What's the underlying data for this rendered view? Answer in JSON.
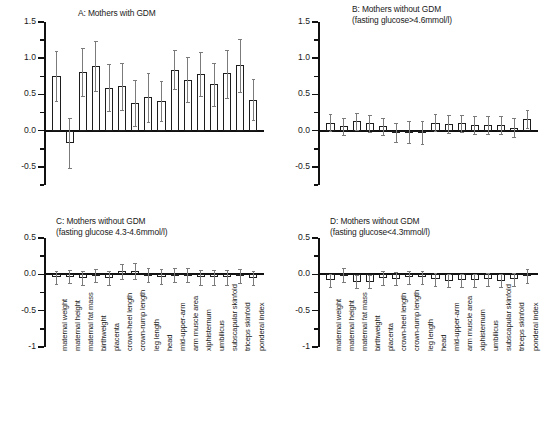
{
  "figure": {
    "width": 550,
    "height": 427,
    "background": "#ffffff",
    "bar_edge_color": "#1d1d1d",
    "bar_fill_color": "#ffffff",
    "error_bar_color": "#7b7b7b",
    "axis_color": "#111111"
  },
  "categories": [
    "maternal weight",
    "maternal height",
    "maternal fat mass",
    "birthweight",
    "placenta",
    "crown-heel length",
    "crown-rump length",
    "leg length",
    "head",
    "mid-upper-arm",
    "arm muscle area",
    "xiphisternum",
    "umbilicus",
    "subscapular skinfold",
    "triceps skinfold",
    "ponderal index"
  ],
  "chart_data": [
    {
      "id": "panel-a",
      "type": "bar",
      "title": "A: Mothers with GDM",
      "subtitle": "",
      "xlabel": "",
      "ylabel": "",
      "ylim": [
        -0.75,
        1.5
      ],
      "yticks": [
        1.5,
        1.0,
        0.5,
        0.0,
        -0.5
      ],
      "yticklabels": [
        "1.5",
        "1.0",
        "0.5",
        "0.0",
        "-0.5"
      ],
      "yminorticks": [
        1.25,
        0.75,
        0.25,
        -0.25,
        -0.75
      ],
      "grid": false,
      "legend": "none",
      "categories": [
        "maternal weight",
        "maternal height",
        "maternal fat mass",
        "birthweight",
        "placenta",
        "crown-heel length",
        "crown-rump length",
        "leg length",
        "head",
        "mid-upper-arm",
        "arm muscle area",
        "xiphisternum",
        "umbilicus",
        "subscapular skinfold",
        "triceps skinfold",
        "ponderal index"
      ],
      "values": [
        0.75,
        -0.17,
        0.81,
        0.89,
        0.59,
        0.61,
        0.38,
        0.46,
        0.41,
        0.84,
        0.7,
        0.78,
        0.64,
        0.79,
        0.9,
        0.43
      ],
      "err_low": [
        0.41,
        -0.52,
        0.48,
        0.55,
        0.27,
        0.29,
        0.06,
        0.12,
        0.14,
        0.57,
        0.39,
        0.48,
        0.34,
        0.45,
        0.54,
        0.15
      ],
      "err_high": [
        1.1,
        0.18,
        1.14,
        1.24,
        0.92,
        0.94,
        0.7,
        0.8,
        0.69,
        1.11,
        1.01,
        1.09,
        0.94,
        1.12,
        1.26,
        0.72
      ]
    },
    {
      "id": "panel-b",
      "type": "bar",
      "title": "B: Mothers without GDM",
      "subtitle": "(fasting glucose>4.6mmol/l)",
      "xlabel": "",
      "ylabel": "",
      "ylim": [
        -0.75,
        1.5
      ],
      "yticks": [
        1.5,
        1.0,
        0.5,
        0.0,
        -0.5
      ],
      "yticklabels": [
        "1.5",
        "1.0",
        "0.5",
        "0.0",
        "-0.5"
      ],
      "yminorticks": [
        1.25,
        0.75,
        0.25,
        -0.25,
        -0.75
      ],
      "grid": false,
      "legend": "none",
      "categories": [
        "maternal weight",
        "maternal height",
        "maternal fat mass",
        "birthweight",
        "placenta",
        "crown-heel length",
        "crown-rump length",
        "leg length",
        "head",
        "mid-upper-arm",
        "arm muscle area",
        "xiphisternum",
        "umbilicus",
        "subscapular skinfold",
        "triceps skinfold",
        "ponderal index"
      ],
      "values": [
        0.11,
        0.06,
        0.13,
        0.1,
        0.06,
        -0.02,
        -0.01,
        -0.01,
        0.11,
        0.09,
        0.1,
        0.08,
        0.08,
        0.08,
        0.04,
        0.16
      ],
      "err_low": [
        -0.01,
        -0.06,
        0.01,
        -0.02,
        -0.06,
        -0.15,
        -0.17,
        -0.18,
        -0.01,
        -0.03,
        -0.02,
        -0.04,
        -0.04,
        -0.04,
        -0.09,
        0.04
      ],
      "err_high": [
        0.23,
        0.18,
        0.25,
        0.22,
        0.18,
        0.11,
        0.13,
        0.13,
        0.23,
        0.21,
        0.22,
        0.2,
        0.2,
        0.2,
        0.17,
        0.28
      ]
    },
    {
      "id": "panel-c",
      "type": "bar",
      "title": "C: Mothers without GDM",
      "subtitle": "(fasting glucose 4.3-4.6mmol/l)",
      "xlabel": "",
      "ylabel": "",
      "ylim": [
        -1.0,
        0.5
      ],
      "yticks": [
        0.5,
        0.0,
        -0.5,
        -1
      ],
      "yticklabels": [
        "0.5",
        "0.0",
        "-0.5",
        "-1"
      ],
      "yminorticks": [
        0.25,
        -0.25,
        -0.75
      ],
      "grid": false,
      "legend": "none",
      "categories": [
        "maternal weight",
        "maternal height",
        "maternal fat mass",
        "birthweight",
        "placenta",
        "crown-heel length",
        "crown-rump length",
        "leg length",
        "head",
        "mid-upper-arm",
        "arm muscle area",
        "xiphisternum",
        "umbilicus",
        "subscapular skinfold",
        "triceps skinfold",
        "ponderal index"
      ],
      "values": [
        -0.04,
        -0.03,
        -0.05,
        -0.02,
        -0.05,
        0.04,
        0.05,
        -0.01,
        -0.03,
        -0.01,
        -0.01,
        -0.04,
        -0.04,
        -0.04,
        -0.02,
        -0.05
      ],
      "err_low": [
        -0.13,
        -0.12,
        -0.14,
        -0.11,
        -0.15,
        -0.06,
        -0.06,
        -0.11,
        -0.13,
        -0.11,
        -0.11,
        -0.14,
        -0.14,
        -0.14,
        -0.12,
        -0.15
      ],
      "err_high": [
        0.05,
        0.06,
        0.04,
        0.07,
        0.05,
        0.14,
        0.16,
        0.09,
        0.07,
        0.09,
        0.09,
        0.06,
        0.06,
        0.06,
        0.08,
        0.05
      ]
    },
    {
      "id": "panel-d",
      "type": "bar",
      "title": "D: Mothers without GDM",
      "subtitle": "(fasting glucose<4.3mmol/l)",
      "xlabel": "",
      "ylabel": "",
      "ylim": [
        -1.0,
        0.5
      ],
      "yticks": [
        0.5,
        0.0,
        -0.5,
        -1
      ],
      "yticklabels": [
        "0.5",
        "0.0",
        "-0.5",
        "-1"
      ],
      "yminorticks": [
        0.25,
        -0.25,
        -0.75
      ],
      "grid": false,
      "legend": "none",
      "categories": [
        "maternal weight",
        "maternal height",
        "maternal fat mass",
        "birthweight",
        "placenta",
        "crown-heel length",
        "crown-rump length",
        "leg length",
        "head",
        "mid-upper-arm",
        "arm muscle area",
        "xiphisternum",
        "umbilicus",
        "subscapular skinfold",
        "triceps skinfold",
        "ponderal index"
      ],
      "values": [
        -0.08,
        -0.01,
        -0.1,
        -0.1,
        -0.05,
        -0.06,
        -0.04,
        -0.04,
        -0.07,
        -0.09,
        -0.08,
        -0.08,
        -0.07,
        -0.09,
        -0.07,
        -0.02
      ],
      "err_low": [
        -0.17,
        -0.11,
        -0.19,
        -0.19,
        -0.14,
        -0.15,
        -0.13,
        -0.13,
        -0.16,
        -0.18,
        -0.17,
        -0.17,
        -0.16,
        -0.18,
        -0.16,
        -0.12
      ],
      "err_high": [
        0.01,
        0.09,
        -0.01,
        -0.01,
        0.04,
        0.03,
        0.05,
        0.05,
        0.02,
        0.0,
        0.01,
        0.01,
        0.02,
        0.0,
        0.02,
        0.08
      ]
    }
  ]
}
